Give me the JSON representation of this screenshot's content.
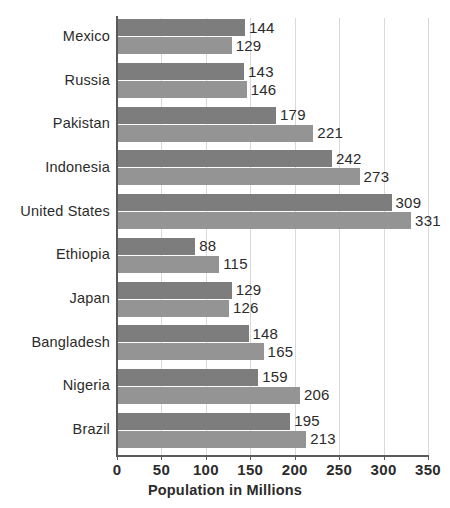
{
  "chart_data": {
    "type": "bar",
    "orientation": "horizontal",
    "grouped": true,
    "title": "",
    "xlabel": "Population in Millions",
    "ylabel": "",
    "xlim": [
      0,
      350
    ],
    "xticks": [
      0,
      50,
      100,
      150,
      200,
      250,
      300,
      350
    ],
    "xtick_labels": [
      "0",
      "50",
      "100",
      "150",
      "200",
      "250",
      "300",
      "350"
    ],
    "grid": "vertical",
    "legend": "none",
    "categories": [
      "Mexico",
      "Russia",
      "Pakistan",
      "Indonesia",
      "United States",
      "Ethiopia",
      "Japan",
      "Bangladesh",
      "Nigeria",
      "Brazil"
    ],
    "series": [
      {
        "name": "series-1",
        "color": "#7d7d7d",
        "values": [
          144,
          143,
          179,
          242,
          309,
          88,
          129,
          148,
          159,
          195
        ]
      },
      {
        "name": "series-2",
        "color": "#949494",
        "values": [
          129,
          146,
          221,
          273,
          331,
          115,
          126,
          165,
          206,
          213
        ]
      }
    ],
    "data_labels": [
      {
        "category": "Mexico",
        "top": "144",
        "bottom": "129"
      },
      {
        "category": "Russia",
        "top": "143",
        "bottom": "146"
      },
      {
        "category": "Pakistan",
        "top": "179",
        "bottom": "221"
      },
      {
        "category": "Indonesia",
        "top": "242",
        "bottom": "273"
      },
      {
        "category": "United States",
        "top": "309",
        "bottom": "331"
      },
      {
        "category": "Ethiopia",
        "top": "88",
        "bottom": "115"
      },
      {
        "category": "Japan",
        "top": "129",
        "bottom": "126"
      },
      {
        "category": "Bangladesh",
        "top": "148",
        "bottom": "165"
      },
      {
        "category": "Nigeria",
        "top": "159",
        "bottom": "206"
      },
      {
        "category": "Brazil",
        "top": "195",
        "bottom": "213"
      }
    ]
  },
  "colors": {
    "background": "#ffffff",
    "bar_top": "#7d7d7d",
    "bar_bottom": "#949494",
    "axis": "#5a5a5a",
    "grid": "#d9d9d9",
    "text": "#2b2b2b"
  }
}
